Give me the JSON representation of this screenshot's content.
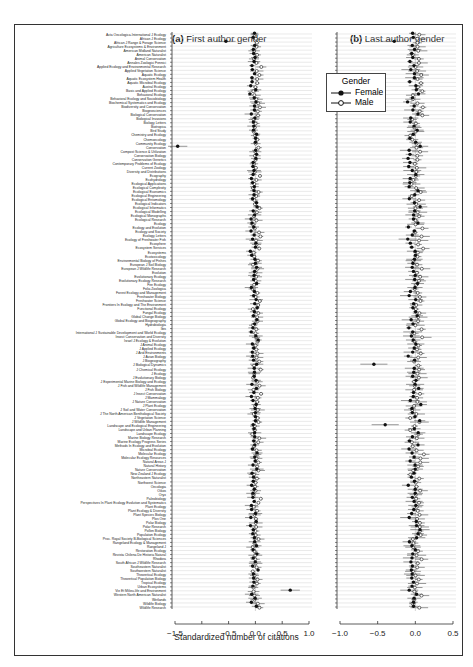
{
  "chart_data": [
    {
      "type": "scatter",
      "subtype": "dot-and-whisker (forest plot)",
      "title": "(a) First author gender",
      "xlabel": "Standardized number of citations",
      "xlim": [
        -1.5,
        1.0
      ],
      "xticks": [
        "-1.5",
        "-0.5",
        "0.0",
        "0.5",
        "1.0"
      ],
      "reference_line": 0.0,
      "grid": "horizontal row lines",
      "series": [
        {
          "name": "Female",
          "marker": "filled circle"
        },
        {
          "name": "Male",
          "marker": "open circle"
        }
      ],
      "notable_points": [
        {
          "row": "African J Range & Forage Science",
          "series": "Female",
          "x": -0.55
        },
        {
          "row": "Conservation",
          "series": "Female",
          "x": -1.45
        },
        {
          "row": "Vie Et Milieu-life and Environment",
          "series": "Female",
          "x": 0.65
        }
      ]
    },
    {
      "type": "scatter",
      "subtype": "dot-and-whisker (forest plot)",
      "title": "(b) Last author gender",
      "xlabel": "Standardized number of citations",
      "xlim": [
        -1.0,
        0.5
      ],
      "xticks": [
        "-1.0",
        "-0.5",
        "0.0",
        "0.5"
      ],
      "reference_line": 0.0,
      "grid": "horizontal row lines",
      "series": [
        {
          "name": "Female",
          "marker": "filled circle"
        },
        {
          "name": "Male",
          "marker": "open circle"
        }
      ],
      "notable_points": [
        {
          "row": "African J Range & Forage Science",
          "series": "Female",
          "x": -0.28
        },
        {
          "row": "J Biological Dynamics",
          "series": "Female",
          "x": -0.55
        },
        {
          "row": "Landscape and Ecological Engineering",
          "series": "Female",
          "x": -0.4
        }
      ]
    }
  ],
  "panels": {
    "a_title_letter": "(a)",
    "a_title_text": "First author gender",
    "b_title_letter": "(b)",
    "b_title_text": "Last author gender",
    "xlabel": "Standardized number of citations"
  },
  "legend": {
    "title": "Gender",
    "items": [
      {
        "label": "Female",
        "marker": "filled"
      },
      {
        "label": "Male",
        "marker": "open"
      }
    ]
  },
  "journals": [
    "Acta Oecologica-International J Ecology",
    "African J Ecology",
    "African J Range & Forage Science",
    "Agriculture Ecosystems & Environment",
    "American Midland Naturalist",
    "American Naturalist",
    "Animal Conservation",
    "Annales Zoologici Fennici",
    "Applied Ecology and Environmental Research",
    "Applied Vegetation Science",
    "Aquatic Ecology",
    "Aquatic Ecosystem Health",
    "Aquatic Microbial Ecology",
    "Austral Ecology",
    "Basic and Applied Ecology",
    "Behavioral Ecology",
    "Behavioral Ecology and Sociobiology",
    "Biochemical Systematics and Ecology",
    "Biodiversity and Conservation",
    "Biogeosciences",
    "Biological Conservation",
    "Biological Invasions",
    "Biology Letters",
    "Biotropica",
    "Bird Study",
    "Chemistry and Ecology",
    "Chemoecology",
    "Community Ecology",
    "Conservation",
    "Compost Science & Utilization",
    "Conservation Biology",
    "Conservation Genetics",
    "Contemporary Problems of Ecology",
    "Current Zoology",
    "Diversity and Distributions",
    "Ecography",
    "Ecohydrology",
    "Ecological Applications",
    "Ecological Complexity",
    "Ecological Economics",
    "Ecological Engineering",
    "Ecological Entomology",
    "Ecological Indicators",
    "Ecological Informatics",
    "Ecological Modelling",
    "Ecological Monographs",
    "Ecological Research",
    "Ecology",
    "Ecology and Evolution",
    "Ecology and Society",
    "Ecology Letters",
    "Ecology of Freshwater Fish",
    "Ecosphere",
    "Ecosystem Services",
    "Ecosystems",
    "Ecotoxicology",
    "Environmental Biology of Fishes",
    "European J Soil Biology",
    "European J Wildlife Research",
    "Evolution",
    "Evolutionary Ecology",
    "Evolutionary Ecology Research",
    "Fire Ecology",
    "Folia Zoologica",
    "Forest Ecology and Management",
    "Freshwater Biology",
    "Freshwater Science",
    "Frontiers In Ecology and The Environment",
    "Functional Ecology",
    "Fungal Ecology",
    "Global Change Biology",
    "Global Ecology and Biogeography",
    "Hydrobiologia",
    "Ibis",
    "International J Sustainable Development and World Ecology",
    "Insect Conservation and Diversity",
    "Israel J Ecology & Evolution",
    "J Animal Ecology",
    "J Applied Ecology",
    "J Arid Environments",
    "J Avian Biology",
    "J Biogeography",
    "J Biological Dynamics",
    "J Chemical Ecology",
    "J Ecology",
    "J Evolutionary Biology",
    "J Experimental Marine Biology and Ecology",
    "J Fish and Wildlife Management",
    "J Fish Biology",
    "J Insect Conservation",
    "J Mammalogy",
    "J Nature Conservation",
    "J Plant Ecology",
    "J Soil and Water Conservation",
    "J The North American Benthological Society",
    "J Vegetation Science",
    "J Wildlife Management",
    "Landscape and Ecological Engineering",
    "Landscape and Urban Planning",
    "Landscape Ecology",
    "Marine Biology Research",
    "Marine Ecology Progress Series",
    "Methods In Ecology and Evolution",
    "Microbial Ecology",
    "Molecular Ecology",
    "Molecular Ecology Resources",
    "Natural Areas J",
    "Natural History",
    "Nature Conservation",
    "New Zealand J Ecology",
    "Northeastern Naturalist",
    "Northwest Science",
    "Oecologia",
    "Oikos",
    "Oryx",
    "Paleobiology",
    "Perspectives In Plant Ecology Evolution and Systematics",
    "Plant Ecology",
    "Plant Ecology & Diversity",
    "Plant Species Biology",
    "Plos One",
    "Polar Biology",
    "Polar Research",
    "Pollen Biology",
    "Population Ecology",
    "Proc. Royal Society B-Biological Sciences",
    "Rangeland Ecology & Management",
    "Rangeland J",
    "Restoration Ecology",
    "Revista Chilena De Historia Natural",
    "Rhodora",
    "South African J Wildlife Research",
    "Southeastern Naturalist",
    "Southwestern Naturalist",
    "Theoretical Ecology",
    "Theoretical Population Biology",
    "Tropical Ecology",
    "Urban Ecosystems",
    "Vie Et Milieu-life and Environment",
    "Western North American Naturalist",
    "Wetlands",
    "Wildlife Biology",
    "Wildlife Research"
  ]
}
